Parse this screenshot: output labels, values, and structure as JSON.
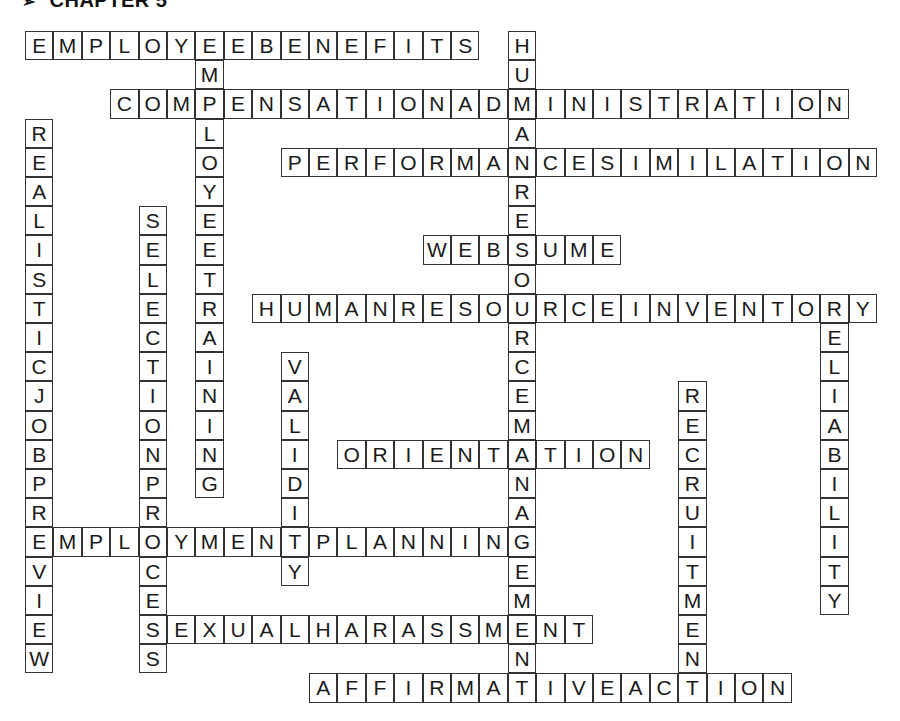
{
  "page": {
    "title_marker": "➢",
    "title": "CHAPTER 5"
  },
  "grid": {
    "origin_x": 25,
    "origin_y": 31,
    "cell_w": 28.4,
    "cell_h": 29.2,
    "cols": 30,
    "rows": 23
  },
  "words": [
    {
      "word": "EMPLOYEEBENEFITS",
      "dir": "across",
      "col": 0,
      "row": 0
    },
    {
      "word": "HUMANRESOURCEMANAGEMENT",
      "dir": "down",
      "col": 17,
      "row": 0
    },
    {
      "word": "EMPLOYEETRAINING",
      "dir": "down",
      "col": 6,
      "row": 0
    },
    {
      "word": "COMPENSATIONADMINISTRATION",
      "dir": "across",
      "col": 3,
      "row": 2
    },
    {
      "word": "REALISTICJOBPREVIEW",
      "dir": "down",
      "col": 0,
      "row": 3
    },
    {
      "word": "PERFORMANCESIMILATION",
      "dir": "across",
      "col": 9,
      "row": 4
    },
    {
      "word": "SELECTIONPROCESS",
      "dir": "down",
      "col": 4,
      "row": 6
    },
    {
      "word": "WEBSUME",
      "dir": "across",
      "col": 14,
      "row": 7
    },
    {
      "word": "HUMANRESOURCEINVENTORY",
      "dir": "across",
      "col": 8,
      "row": 9
    },
    {
      "word": "RELIABILITY",
      "dir": "down",
      "col": 28,
      "row": 9
    },
    {
      "word": "VALIDITY",
      "dir": "down",
      "col": 9,
      "row": 11
    },
    {
      "word": "RECRUITMENT",
      "dir": "down",
      "col": 23,
      "row": 12
    },
    {
      "word": "ORIENTATION",
      "dir": "across",
      "col": 11,
      "row": 14
    },
    {
      "word": "EMPLOYMENTPLANNING",
      "dir": "across",
      "col": 0,
      "row": 17
    },
    {
      "word": "SEXUALHARASSMENT",
      "dir": "across",
      "col": 4,
      "row": 20
    },
    {
      "word": "AFFIRMATIVEACTION",
      "dir": "across",
      "col": 10,
      "row": 22
    }
  ]
}
